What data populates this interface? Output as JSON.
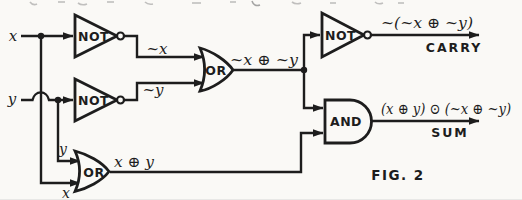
{
  "figure": {
    "caption": "FIG. 2",
    "ink_color": "#1d1d1d",
    "paper_color": "#faf9f6"
  },
  "inputs": {
    "x": "x",
    "y": "y"
  },
  "gates": {
    "not1": {
      "label": "NOT"
    },
    "not2": {
      "label": "NOT"
    },
    "not3": {
      "label": "NOT"
    },
    "or1": {
      "label": "OR"
    },
    "or2": {
      "label": "OR"
    },
    "and1": {
      "label": "AND"
    }
  },
  "signals": {
    "not_x": "~x",
    "not_y": "~y",
    "or1_out": "~x ⊕ ~y",
    "or2_out": "x ⊕ y",
    "or2_in_top": "y",
    "or2_in_bottom": "x",
    "carry_expr": "~(~x ⊕ ~y)",
    "carry_label": "CARRY",
    "sum_expr": "(x ⊕ y) ⊙ (~x ⊕ ~y)",
    "sum_label": "SUM"
  }
}
